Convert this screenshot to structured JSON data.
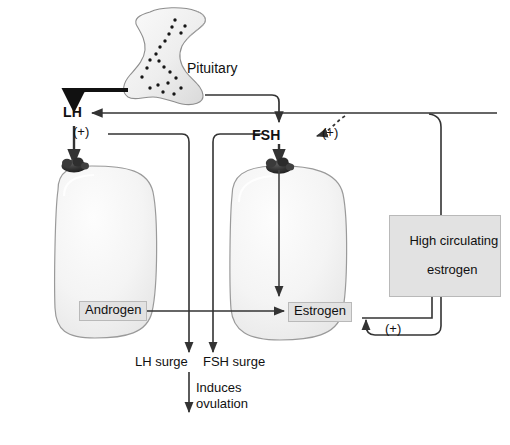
{
  "figure": {
    "background_color": "#ffffff",
    "line_color": "#222222",
    "label_box_fill": "#e2e2e2",
    "label_box_border": "#b9b9b9",
    "cell_fill": "#f4f4f4",
    "cell_border": "#9a9a9a",
    "cap_color": "#2b2b2b"
  },
  "organs": {
    "pituitary_label": "Pituitary"
  },
  "hormones": {
    "lh": "LH",
    "fsh": "FSH"
  },
  "signs": {
    "lh_plus": "(+)",
    "fsh_plus": "(+)",
    "estrogen_plus": "(+)"
  },
  "boxes": {
    "androgen": "Androgen",
    "estrogen": "Estrogen",
    "high_circulating_estrogen_line1": "High circulating",
    "high_circulating_estrogen_line2": "estrogen"
  },
  "outputs": {
    "lh_surge": "LH surge",
    "fsh_surge": "FSH surge",
    "induces": "Induces",
    "ovulation": "ovulation"
  }
}
